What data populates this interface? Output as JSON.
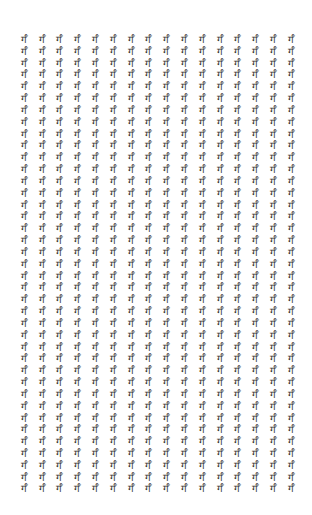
{
  "grid": {
    "glyph": "र्गँ",
    "columns": 16,
    "rows": 39,
    "text_color": "#333333",
    "background": "#ffffff"
  }
}
